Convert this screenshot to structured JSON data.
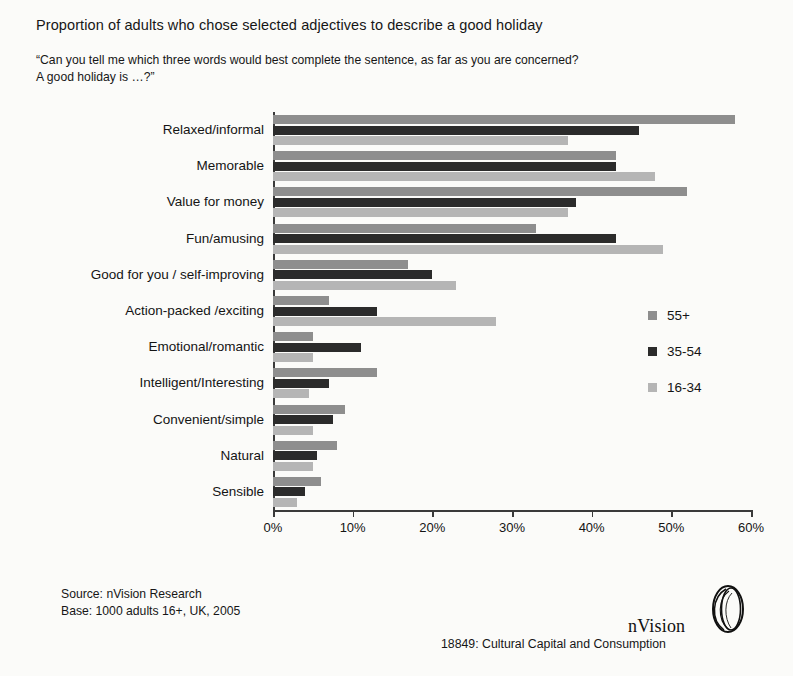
{
  "title": "Proportion of adults who chose selected adjectives to describe a good holiday",
  "question_line1": "“Can you tell me which three words would best complete the sentence, as far as you are concerned?",
  "question_line2": "A good holiday is …?”",
  "source_line1": "Source: nVision Research",
  "source_line2": "Base: 1000 adults 16+, UK, 2005",
  "brand": {
    "name": "nVision",
    "mark": "nvision-logo-icon"
  },
  "reference": "18849: Cultural Capital and Consumption",
  "legend": {
    "position": "right-middle",
    "entries": [
      {
        "label": "55+",
        "color": "#8e8e8e"
      },
      {
        "label": "35-54",
        "color": "#2b2b2b"
      },
      {
        "label": "16-34",
        "color": "#b5b5b5"
      }
    ]
  },
  "chart_data": {
    "type": "bar",
    "orientation": "horizontal",
    "title": "Proportion of adults who chose selected adjectives to describe a good holiday",
    "xlabel": "",
    "ylabel": "",
    "xlim": [
      0,
      60
    ],
    "grid": false,
    "tick_labels": [
      "0%",
      "10%",
      "20%",
      "30%",
      "40%",
      "50%",
      "60%"
    ],
    "tick_values": [
      0,
      10,
      20,
      30,
      40,
      50,
      60
    ],
    "categories": [
      "Relaxed/informal",
      "Memorable",
      "Value for money",
      "Fun/amusing",
      "Good for you / self-improving",
      "Action-packed /exciting",
      "Emotional/romantic",
      "Intelligent/Interesting",
      "Convenient/simple",
      "Natural",
      "Sensible"
    ],
    "series": [
      {
        "name": "55+",
        "color": "#8e8e8e",
        "values": [
          58,
          43,
          52,
          33,
          17,
          7,
          5,
          13,
          9,
          8,
          6
        ]
      },
      {
        "name": "35-54",
        "color": "#2b2b2b",
        "values": [
          46,
          43,
          38,
          43,
          20,
          13,
          11,
          7,
          7.5,
          5.5,
          4
        ]
      },
      {
        "name": "16-34",
        "color": "#b5b5b5",
        "values": [
          37,
          48,
          37,
          49,
          23,
          28,
          5,
          4.5,
          5,
          5,
          3
        ]
      }
    ]
  }
}
